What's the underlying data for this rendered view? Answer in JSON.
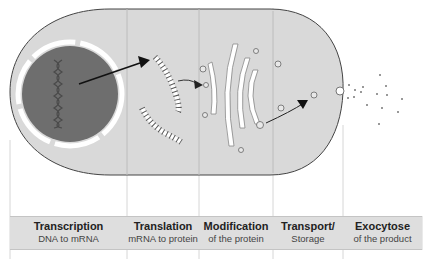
{
  "stages": [
    {
      "title": "Transcription",
      "subtitle": "DNA to mRNA"
    },
    {
      "title": "Translation",
      "subtitle": "mRNA to protein"
    },
    {
      "title": "Modification",
      "subtitle": "of the protein"
    },
    {
      "title": "Transport/",
      "subtitle": "Storage"
    },
    {
      "title": "Exocytose",
      "subtitle": "of the product"
    }
  ],
  "colors": {
    "cytoplasm": "#d9d9d9",
    "nucleus": "#6e6e6e",
    "band": "#dedede",
    "outline": "#444444"
  }
}
